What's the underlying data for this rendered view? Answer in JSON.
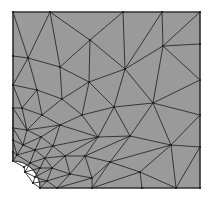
{
  "figure": {
    "type": "finite-element-mesh",
    "colors": {
      "fill": "#9a9a9a",
      "edge": "#2a2a2a",
      "border": "#333333",
      "background": "#ffffff"
    },
    "boundary": {
      "left": 13,
      "top": 12,
      "right": 200,
      "bottom": 188,
      "hole": {
        "cx": 13,
        "cy": 188,
        "r": 27
      }
    },
    "nodes": [
      [
        13,
        12
      ],
      [
        50,
        12
      ],
      [
        123,
        12
      ],
      [
        162,
        12
      ],
      [
        200,
        12
      ],
      [
        200,
        44
      ],
      [
        200,
        80
      ],
      [
        200,
        115
      ],
      [
        200,
        147
      ],
      [
        200,
        188
      ],
      [
        176,
        188
      ],
      [
        142,
        188
      ],
      [
        92,
        188
      ],
      [
        57,
        188
      ],
      [
        40,
        188
      ],
      [
        13,
        161
      ],
      [
        13,
        152
      ],
      [
        13,
        140
      ],
      [
        13,
        128
      ],
      [
        13,
        108
      ],
      [
        13,
        85
      ],
      [
        13,
        56
      ],
      [
        90,
        40
      ],
      [
        163,
        46
      ],
      [
        28,
        58
      ],
      [
        60,
        67
      ],
      [
        125,
        69
      ],
      [
        89,
        82
      ],
      [
        37,
        90
      ],
      [
        62,
        99
      ],
      [
        153,
        103
      ],
      [
        114,
        107
      ],
      [
        22,
        108
      ],
      [
        42,
        115
      ],
      [
        82,
        115
      ],
      [
        60,
        125
      ],
      [
        98,
        137
      ],
      [
        130,
        136
      ],
      [
        171,
        145
      ],
      [
        27,
        130
      ],
      [
        41,
        137
      ],
      [
        53,
        146
      ],
      [
        23,
        145
      ],
      [
        35,
        150
      ],
      [
        17,
        155
      ],
      [
        45,
        158
      ],
      [
        65,
        156
      ],
      [
        85,
        156
      ],
      [
        110,
        162
      ],
      [
        140,
        172
      ],
      [
        30,
        163
      ],
      [
        40,
        168
      ],
      [
        52,
        168
      ],
      [
        70,
        174
      ],
      [
        92,
        178
      ],
      [
        25,
        172
      ],
      [
        35,
        177
      ],
      [
        47,
        181
      ],
      [
        33,
        183
      ],
      [
        24,
        167
      ]
    ],
    "edges": [
      [
        0,
        1
      ],
      [
        1,
        2
      ],
      [
        2,
        3
      ],
      [
        3,
        4
      ],
      [
        4,
        5
      ],
      [
        5,
        6
      ],
      [
        6,
        7
      ],
      [
        7,
        8
      ],
      [
        8,
        9
      ],
      [
        9,
        10
      ],
      [
        10,
        11
      ],
      [
        11,
        12
      ],
      [
        12,
        13
      ],
      [
        13,
        14
      ],
      [
        15,
        16
      ],
      [
        16,
        17
      ],
      [
        17,
        18
      ],
      [
        18,
        19
      ],
      [
        19,
        20
      ],
      [
        20,
        21
      ],
      [
        21,
        0
      ],
      [
        0,
        24
      ],
      [
        1,
        24
      ],
      [
        1,
        22
      ],
      [
        1,
        25
      ],
      [
        2,
        22
      ],
      [
        2,
        26
      ],
      [
        3,
        26
      ],
      [
        3,
        23
      ],
      [
        4,
        23
      ],
      [
        5,
        23
      ],
      [
        22,
        25
      ],
      [
        22,
        26
      ],
      [
        22,
        27
      ],
      [
        25,
        24
      ],
      [
        25,
        27
      ],
      [
        24,
        21
      ],
      [
        24,
        28
      ],
      [
        24,
        20
      ],
      [
        26,
        23
      ],
      [
        26,
        27
      ],
      [
        26,
        30
      ],
      [
        23,
        30
      ],
      [
        23,
        6
      ],
      [
        30,
        6
      ],
      [
        30,
        7
      ],
      [
        30,
        38
      ],
      [
        30,
        37
      ],
      [
        30,
        31
      ],
      [
        26,
        31
      ],
      [
        27,
        31
      ],
      [
        27,
        29
      ],
      [
        27,
        34
      ],
      [
        25,
        29
      ],
      [
        28,
        29
      ],
      [
        28,
        20
      ],
      [
        28,
        32
      ],
      [
        28,
        33
      ],
      [
        20,
        32
      ],
      [
        29,
        33
      ],
      [
        29,
        34
      ],
      [
        31,
        34
      ],
      [
        31,
        37
      ],
      [
        31,
        36
      ],
      [
        34,
        36
      ],
      [
        34,
        35
      ],
      [
        33,
        35
      ],
      [
        33,
        32
      ],
      [
        32,
        19
      ],
      [
        32,
        39
      ],
      [
        33,
        39
      ],
      [
        35,
        39
      ],
      [
        35,
        40
      ],
      [
        35,
        41
      ],
      [
        35,
        36
      ],
      [
        36,
        41
      ],
      [
        36,
        46
      ],
      [
        36,
        47
      ],
      [
        36,
        37
      ],
      [
        37,
        47
      ],
      [
        37,
        48
      ],
      [
        37,
        38
      ],
      [
        38,
        7
      ],
      [
        38,
        8
      ],
      [
        38,
        48
      ],
      [
        38,
        49
      ],
      [
        38,
        10
      ],
      [
        8,
        10
      ],
      [
        19,
        39
      ],
      [
        19,
        18
      ],
      [
        39,
        18
      ],
      [
        39,
        42
      ],
      [
        39,
        40
      ],
      [
        40,
        42
      ],
      [
        40,
        43
      ],
      [
        40,
        41
      ],
      [
        41,
        43
      ],
      [
        41,
        45
      ],
      [
        41,
        46
      ],
      [
        18,
        42
      ],
      [
        18,
        17
      ],
      [
        42,
        17
      ],
      [
        42,
        43
      ],
      [
        42,
        44
      ],
      [
        17,
        44
      ],
      [
        43,
        44
      ],
      [
        43,
        45
      ],
      [
        43,
        50
      ],
      [
        44,
        16
      ],
      [
        44,
        50
      ],
      [
        16,
        15
      ],
      [
        44,
        15
      ],
      [
        45,
        50
      ],
      [
        45,
        51
      ],
      [
        45,
        52
      ],
      [
        45,
        46
      ],
      [
        46,
        52
      ],
      [
        46,
        53
      ],
      [
        46,
        47
      ],
      [
        47,
        53
      ],
      [
        47,
        54
      ],
      [
        47,
        48
      ],
      [
        48,
        54
      ],
      [
        48,
        49
      ],
      [
        48,
        12
      ],
      [
        49,
        12
      ],
      [
        49,
        11
      ],
      [
        49,
        10
      ],
      [
        50,
        51
      ],
      [
        50,
        59
      ],
      [
        15,
        59
      ],
      [
        59,
        55
      ],
      [
        50,
        55
      ],
      [
        51,
        55
      ],
      [
        51,
        56
      ],
      [
        51,
        52
      ],
      [
        52,
        56
      ],
      [
        52,
        57
      ],
      [
        52,
        53
      ],
      [
        53,
        57
      ],
      [
        53,
        13
      ],
      [
        53,
        54
      ],
      [
        54,
        13
      ],
      [
        54,
        12
      ],
      [
        55,
        56
      ],
      [
        56,
        57
      ],
      [
        56,
        58
      ],
      [
        57,
        13
      ],
      [
        57,
        58
      ],
      [
        58,
        14
      ],
      [
        57,
        14
      ],
      [
        55,
        58
      ]
    ],
    "node_radius": 1.1
  }
}
